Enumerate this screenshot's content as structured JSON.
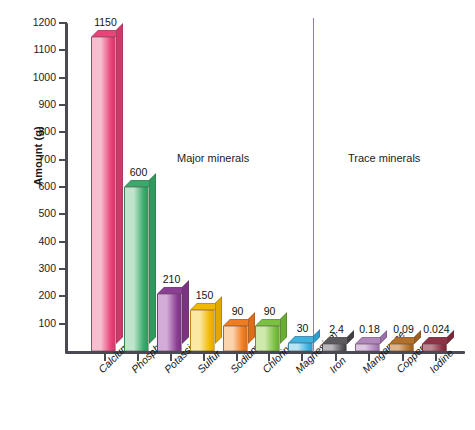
{
  "chart_data": {
    "type": "bar",
    "title": "",
    "xlabel": "",
    "ylabel": "Amount (g)",
    "ylim": [
      0,
      1200
    ],
    "ytick_labels": [
      "1200",
      "1100",
      "1000",
      "900",
      "800",
      "700",
      "600",
      "500",
      "400",
      "300",
      "200",
      "100"
    ],
    "ytick_values": [
      1200,
      1100,
      1000,
      900,
      800,
      700,
      600,
      500,
      400,
      300,
      200,
      100
    ],
    "grid": false,
    "legend": "none",
    "annotations": [
      "Major minerals",
      "Trace minerals"
    ],
    "group_labels": {
      "major": "Major minerals",
      "trace": "Trace minerals"
    },
    "categories": [
      "Calcium",
      "Phosphorus",
      "Potassium",
      "Sulfur",
      "Sodium",
      "Chlorine",
      "Magnesium",
      "Iron",
      "Manganese",
      "Copper",
      "Iodine"
    ],
    "values": [
      1150,
      600,
      210,
      150,
      90,
      90,
      30,
      2.4,
      0.18,
      0.09,
      0.024
    ],
    "value_labels": [
      "1150",
      "600",
      "210",
      "150",
      "90",
      "90",
      "30",
      "2.4",
      "0.18",
      "0.09",
      "0.024"
    ],
    "bars": [
      {
        "label": "Calcium",
        "value": 1150,
        "value_label": "1150",
        "group": "major",
        "color": "#e8447a",
        "color_light": "#f6bfd0",
        "color_dark": "#d2376a"
      },
      {
        "label": "Phosphorus",
        "value": 600,
        "value_label": "600",
        "group": "major",
        "color": "#3aa96b",
        "color_light": "#bfe6cd",
        "color_dark": "#2e9a5d"
      },
      {
        "label": "Potassium",
        "value": 210,
        "value_label": "210",
        "group": "major",
        "color": "#8b3f94",
        "color_light": "#d3acd8",
        "color_dark": "#7a3383"
      },
      {
        "label": "Sulfur",
        "value": 150,
        "value_label": "150",
        "group": "major",
        "color": "#f0b800",
        "color_light": "#fbe9a3",
        "color_dark": "#e0a800"
      },
      {
        "label": "Sodium",
        "value": 90,
        "value_label": "90",
        "group": "major",
        "color": "#f07c22",
        "color_light": "#fbd4ad",
        "color_dark": "#dd6d16"
      },
      {
        "label": "Chlorine",
        "value": 90,
        "value_label": "90",
        "group": "major",
        "color": "#7bc141",
        "color_light": "#cfe8ac",
        "color_dark": "#68ad34"
      },
      {
        "label": "Magnesium",
        "value": 30,
        "value_label": "30",
        "group": "major",
        "color": "#3fb3e0",
        "color_light": "#b7e4f5",
        "color_dark": "#2ba0cd"
      },
      {
        "label": "Iron",
        "value": 2.4,
        "value_label": "2.4",
        "group": "trace",
        "color": "#5a5a5f",
        "color_light": "#b9b9bd",
        "color_dark": "#3f3f44"
      },
      {
        "label": "Manganese",
        "value": 0.18,
        "value_label": "0.18",
        "group": "trace",
        "color": "#b087bd",
        "color_light": "#ddc6e4",
        "color_dark": "#9a71a8"
      },
      {
        "label": "Copper",
        "value": 0.09,
        "value_label": "0.09",
        "group": "trace",
        "color": "#b3702a",
        "color_light": "#ddb387",
        "color_dark": "#9d5f1f"
      },
      {
        "label": "Iodine",
        "value": 0.024,
        "value_label": "0.024",
        "group": "trace",
        "color": "#8e3347",
        "color_light": "#c08592",
        "color_dark": "#7a2738"
      }
    ],
    "colors": {
      "axis": "#4a4a52",
      "divider": "#8f7fa8",
      "text": "#141414",
      "background": "#ffffff"
    }
  }
}
